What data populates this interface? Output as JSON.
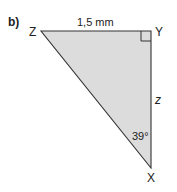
{
  "problem_label": "b)",
  "vertices": {
    "Z": "Z",
    "Y": "Y",
    "X": "X"
  },
  "side_labels": {
    "ZY": "1,5 mm",
    "YX": "z"
  },
  "angle_labels": {
    "X": "39°"
  },
  "right_angle_at": "Y",
  "colors": {
    "fill": "#dcdcdc",
    "stroke": "#333333"
  }
}
